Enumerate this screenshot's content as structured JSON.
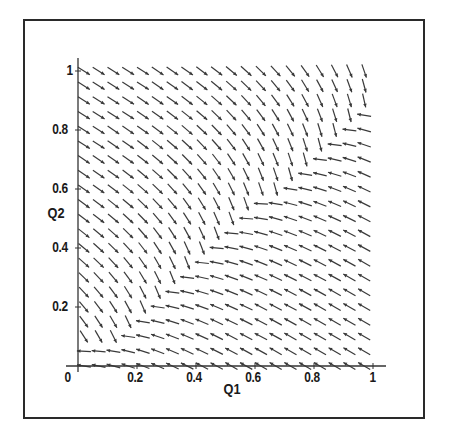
{
  "chart_data": {
    "type": "vector_field",
    "title": "",
    "xlabel": "Q1",
    "ylabel": "Q2",
    "xlim": [
      0,
      1
    ],
    "ylim": [
      0,
      1
    ],
    "x_ticks": [
      {
        "value": 0,
        "label": "0"
      },
      {
        "value": 0.2,
        "label": "0.2"
      },
      {
        "value": 0.4,
        "label": "0.4"
      },
      {
        "value": 0.6,
        "label": "0.6"
      },
      {
        "value": 0.8,
        "label": "0.8"
      },
      {
        "value": 1,
        "label": "1"
      }
    ],
    "y_ticks": [
      {
        "value": 0.2,
        "label": "0.2"
      },
      {
        "value": 0.4,
        "label": "0.4"
      },
      {
        "value": 0.6,
        "label": "0.6"
      },
      {
        "value": 0.8,
        "label": "0.8"
      },
      {
        "value": 1,
        "label": "1"
      }
    ],
    "grid": false,
    "legend": null,
    "arrow_grid": {
      "x_start": 0,
      "x_end": 1,
      "y_start": 0,
      "y_end": 1,
      "step": 0.05,
      "count_per_axis": 21
    },
    "arrow_style": "normalized direction field, fixed arrow length",
    "attractor_curve": [
      [
        0.05,
        0.05
      ],
      [
        0.15,
        0.12
      ],
      [
        0.25,
        0.22
      ],
      [
        0.35,
        0.31
      ],
      [
        0.45,
        0.4
      ],
      [
        0.55,
        0.49
      ],
      [
        0.65,
        0.58
      ],
      [
        0.75,
        0.67
      ],
      [
        0.85,
        0.76
      ],
      [
        0.95,
        0.86
      ],
      [
        1.0,
        0.95
      ]
    ],
    "sample_directions": [
      {
        "at": [
          0.1,
          0.9
        ],
        "direction": "down-right"
      },
      {
        "at": [
          0.5,
          0.9
        ],
        "direction": "down-right"
      },
      {
        "at": [
          0.95,
          0.95
        ],
        "direction": "down"
      },
      {
        "at": [
          0.9,
          0.5
        ],
        "direction": "left"
      },
      {
        "at": [
          0.9,
          0.2
        ],
        "direction": "up-left"
      },
      {
        "at": [
          0.5,
          0.1
        ],
        "direction": "up-left"
      },
      {
        "at": [
          0.4,
          0.3
        ],
        "direction": "down"
      },
      {
        "at": [
          0.05,
          0.05
        ],
        "direction": "down"
      }
    ]
  },
  "colors": {
    "frame": "#2a2a2a",
    "axis": "#333333",
    "arrow": "#3a3a3a",
    "background": "#ffffff"
  }
}
